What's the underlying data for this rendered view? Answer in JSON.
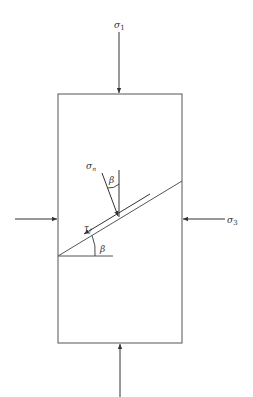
{
  "diagram": {
    "type": "stress-on-failure-plane",
    "labels": {
      "sigma1": {
        "symbol": "σ",
        "sub": "1"
      },
      "sigma3": {
        "symbol": "σ",
        "sub": "3"
      },
      "sigma_n": {
        "symbol": "σ",
        "sub": "n"
      },
      "tau_f": {
        "symbol": "τ",
        "sub": "f"
      },
      "beta_top": "β",
      "beta_bottom": "β"
    },
    "colors": {
      "line": "#555555",
      "text": "#333333",
      "background": "#ffffff"
    }
  }
}
